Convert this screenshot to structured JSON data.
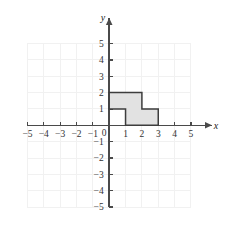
{
  "chart_data": {
    "type": "scatter",
    "title": "",
    "subtitle": "",
    "xlabel": "x",
    "ylabel": "y",
    "xlim": [
      -5,
      5
    ],
    "ylim": [
      -5,
      5
    ],
    "grid": true,
    "legend": null,
    "origin_label": "0",
    "x_ticks": [
      -5,
      -4,
      -3,
      -2,
      -1,
      1,
      2,
      3,
      4,
      5
    ],
    "y_ticks": [
      5,
      4,
      3,
      2,
      1,
      -1,
      -2,
      -3,
      -4,
      -5
    ],
    "x_tick_labels": [
      "−5",
      "−4",
      "−3",
      "−2",
      "−1",
      "1",
      "2",
      "3",
      "4",
      "5"
    ],
    "y_tick_labels": [
      "5",
      "4",
      "3",
      "2",
      "1",
      "−1",
      "−2",
      "−3",
      "−4",
      "−5"
    ],
    "axis_color": "#4a4a4a",
    "grid_color": "#f1f1f1",
    "background_color": "#ffffff",
    "shapes": [
      {
        "name": "shaded-step-polygon",
        "kind": "polygon",
        "fill": "#e2e2e2",
        "stroke": "#3d3d3d",
        "vertices": [
          [
            0,
            1
          ],
          [
            0,
            2
          ],
          [
            2,
            2
          ],
          [
            2,
            1
          ],
          [
            3,
            1
          ],
          [
            3,
            0
          ],
          [
            1,
            0
          ],
          [
            1,
            1
          ]
        ]
      }
    ],
    "annotations": []
  }
}
